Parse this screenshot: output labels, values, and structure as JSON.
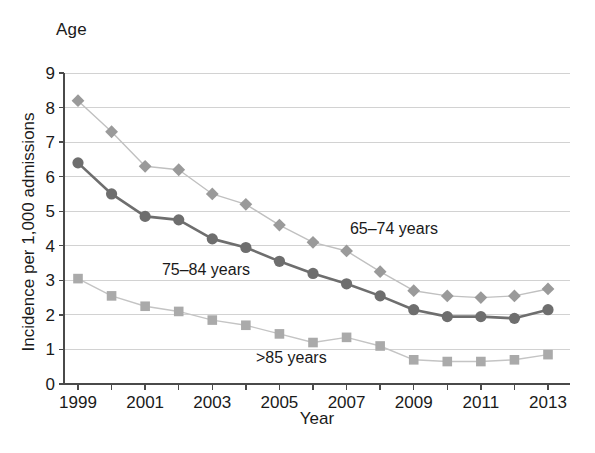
{
  "figure": {
    "age_heading": "Age",
    "xlabel": "Year",
    "ylabel": "Incidence per 1,000 admissions"
  },
  "chart_data": {
    "type": "line",
    "title": "Age",
    "xlabel": "Year",
    "ylabel": "Incidence per 1,000 admissions",
    "x": [
      1999,
      2000,
      2001,
      2002,
      2003,
      2004,
      2005,
      2006,
      2007,
      2008,
      2009,
      2010,
      2011,
      2012,
      2013
    ],
    "xtick_labels": [
      "1999",
      "",
      "2001",
      "",
      "2003",
      "",
      "2005",
      "",
      "2007",
      "",
      "2009",
      "",
      "2011",
      "",
      "2013"
    ],
    "ytick_labels": [
      "0",
      "1",
      "2",
      "3",
      "4",
      "5",
      "6",
      "7",
      "8",
      "9"
    ],
    "xlim": [
      1999,
      2013
    ],
    "ylim": [
      0,
      9
    ],
    "grid": "horizontal",
    "legend_position": "inline-annotations",
    "series": [
      {
        "name": "65-74 years",
        "label": "65–74 years",
        "marker": "diamond",
        "color": "#9a9a9a",
        "line_color": "#c0c0c0",
        "label_x": 2007.1,
        "label_y": 4.35,
        "values": [
          8.2,
          7.3,
          6.3,
          6.2,
          5.5,
          5.2,
          4.6,
          4.1,
          3.85,
          3.25,
          2.7,
          2.55,
          2.5,
          2.55,
          2.75
        ]
      },
      {
        "name": "75-84 years",
        "label": "75–84 years",
        "marker": "circle",
        "color": "#6e6e6e",
        "line_color": "#6e6e6e",
        "label_x": 2001.5,
        "label_y": 3.15,
        "values": [
          6.4,
          5.5,
          4.85,
          4.75,
          4.2,
          3.95,
          3.55,
          3.2,
          2.9,
          2.55,
          2.15,
          1.95,
          1.95,
          1.9,
          2.15
        ]
      },
      {
        "name": ">85 years",
        "label": ">85 years",
        "marker": "square",
        "color": "#aaaaaa",
        "line_color": "#c4c4c4",
        "label_x": 2004.3,
        "label_y": 0.62,
        "values": [
          3.05,
          2.55,
          2.25,
          2.1,
          1.85,
          1.7,
          1.45,
          1.2,
          1.35,
          1.1,
          0.7,
          0.65,
          0.65,
          0.7,
          0.85
        ]
      }
    ]
  }
}
